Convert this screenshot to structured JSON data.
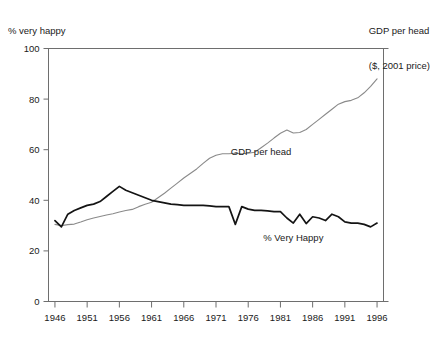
{
  "captions": {
    "left_axis": "% very happy",
    "right_axis_line1": "GDP per head",
    "right_axis_line2": "($, 2001 price)"
  },
  "chart_data": {
    "type": "line",
    "title": "",
    "subtitle": "",
    "xlabel": "",
    "ylabel": "% very happy",
    "y2label": "GDP per head ($, 2001 price)",
    "grid": false,
    "legend_position": "inline-annotation",
    "xlim": [
      1945,
      1997
    ],
    "ylim": [
      0,
      100
    ],
    "xticks": [
      1946,
      1951,
      1956,
      1961,
      1966,
      1971,
      1976,
      1981,
      1986,
      1991,
      1996
    ],
    "xticklabels": [
      "1946",
      "1951",
      "1956",
      "1961",
      "1966",
      "1971",
      "1976",
      "1981",
      "1986",
      "1991",
      "1996"
    ],
    "yticks": [
      0,
      20,
      40,
      60,
      80,
      100
    ],
    "yticklabels": [
      "0",
      "20",
      "40",
      "60",
      "80",
      "100"
    ],
    "annotations": [
      {
        "text": "GDP per head",
        "x": 1978,
        "y": 58,
        "series": "gdp"
      },
      {
        "text": "% Very Happy",
        "x": 1983,
        "y": 24,
        "series": "happy"
      }
    ],
    "colors": {
      "gdp_line": "#8a8a8a",
      "happy_line": "#141414",
      "frame": "#6e6e6e",
      "background": "#ffffff"
    },
    "series": [
      {
        "name": "GDP per head",
        "color": "#8a8a8a",
        "axis": "right",
        "x": [
          1946,
          1947,
          1948,
          1949,
          1950,
          1951,
          1952,
          1953,
          1954,
          1955,
          1956,
          1957,
          1958,
          1959,
          1960,
          1961,
          1962,
          1963,
          1964,
          1965,
          1966,
          1967,
          1968,
          1969,
          1970,
          1971,
          1972,
          1973,
          1974,
          1975,
          1976,
          1977,
          1978,
          1979,
          1980,
          1981,
          1982,
          1983,
          1984,
          1985,
          1986,
          1987,
          1988,
          1989,
          1990,
          1991,
          1992,
          1993,
          1994,
          1995,
          1996
        ],
        "values": [
          30.5,
          30.0,
          30.4,
          30.6,
          31.4,
          32.3,
          33.0,
          33.6,
          34.2,
          34.7,
          35.4,
          36.0,
          36.4,
          37.5,
          38.4,
          39.2,
          41.0,
          42.8,
          44.8,
          46.8,
          48.8,
          50.6,
          52.4,
          54.6,
          56.6,
          57.8,
          58.4,
          58.4,
          58.6,
          58.4,
          58.6,
          59.0,
          60.8,
          62.6,
          64.6,
          66.5,
          67.8,
          66.6,
          66.8,
          68.0,
          70.0,
          72.0,
          74.0,
          76.0,
          78.0,
          79.0,
          79.5,
          80.5,
          82.5,
          85.0,
          88.0
        ]
      },
      {
        "name": "% Very Happy",
        "color": "#141414",
        "axis": "left",
        "x": [
          1946,
          1947,
          1948,
          1949,
          1950,
          1951,
          1952,
          1953,
          1954,
          1955,
          1956,
          1957,
          1958,
          1959,
          1960,
          1961,
          1962,
          1963,
          1964,
          1965,
          1966,
          1967,
          1968,
          1969,
          1970,
          1971,
          1972,
          1973,
          1974,
          1975,
          1976,
          1977,
          1978,
          1979,
          1980,
          1981,
          1982,
          1983,
          1984,
          1985,
          1986,
          1987,
          1988,
          1989,
          1990,
          1991,
          1992,
          1993,
          1994,
          1995,
          1996
        ],
        "values": [
          32.0,
          29.5,
          34.5,
          36.0,
          37.0,
          38.0,
          38.5,
          39.5,
          41.5,
          43.5,
          45.5,
          44.0,
          43.0,
          42.0,
          41.0,
          40.0,
          39.5,
          39.0,
          38.5,
          38.3,
          38.0,
          38.0,
          38.0,
          38.0,
          37.8,
          37.5,
          37.5,
          37.5,
          30.5,
          37.5,
          36.5,
          36.0,
          36.0,
          35.8,
          35.5,
          35.5,
          33.0,
          31.0,
          34.5,
          30.8,
          33.5,
          33.0,
          32.0,
          34.5,
          33.5,
          31.5,
          31.0,
          31.0,
          30.5,
          29.5,
          31.0
        ]
      }
    ]
  }
}
